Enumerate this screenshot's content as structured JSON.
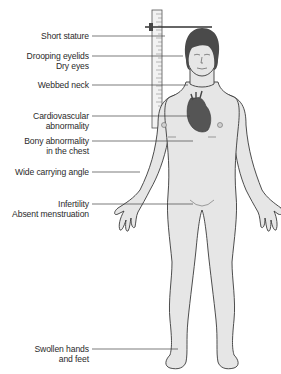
{
  "figure": {
    "title": "",
    "colors": {
      "skin": "#e6e6e6",
      "outline": "#3a3a3a",
      "hair": "#4a4a4a",
      "heart": "#5a5a5a",
      "leader_line": "#444444",
      "text": "#2a2a2a"
    }
  },
  "labels": [
    {
      "id": "short-stature",
      "lines": [
        "Short stature"
      ],
      "top": 33,
      "line_y": 36,
      "target_x": 165
    },
    {
      "id": "drooping-eyelids",
      "lines": [
        "Drooping eyelids",
        "Dry eyes"
      ],
      "top": 50,
      "line_y": 56,
      "target_x": 183
    },
    {
      "id": "webbed-neck",
      "lines": [
        "Webbed neck"
      ],
      "top": 80,
      "line_y": 85,
      "target_x": 188
    },
    {
      "id": "cardiovascular",
      "lines": [
        "Cardiovascular",
        "abnormality"
      ],
      "top": 108,
      "line_y": 116,
      "target_x": 190
    },
    {
      "id": "bony-chest",
      "lines": [
        "Bony abnormality",
        "in the chest"
      ],
      "top": 135,
      "line_y": 141,
      "target_x": 193
    },
    {
      "id": "carrying-angle",
      "lines": [
        "Wide carrying angle"
      ],
      "top": 167,
      "line_y": 172,
      "target_x": 140
    },
    {
      "id": "infertility",
      "lines": [
        "Infertility",
        "Absent menstruation"
      ],
      "top": 199,
      "line_y": 204,
      "target_x": 193
    },
    {
      "id": "swollen",
      "lines": [
        "Swollen hands",
        "and feet"
      ],
      "top": 343,
      "line_y": 349,
      "target_x": 178
    }
  ]
}
